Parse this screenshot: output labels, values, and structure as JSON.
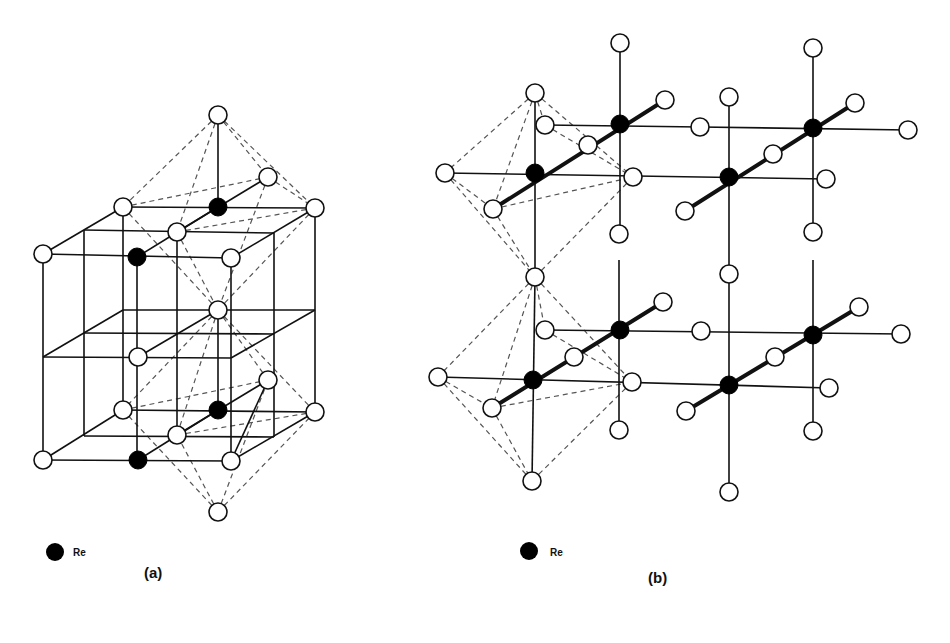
{
  "figure": {
    "panels": [
      {
        "id": "a",
        "label": "(a)",
        "label_pos": [
          144,
          578
        ],
        "legend": {
          "symbol": "filled-circle",
          "text": "Re",
          "symbol_pos": [
            55,
            552
          ],
          "text_pos": [
            73,
            556
          ]
        },
        "solid_lines": [
          [
            43,
            254,
            231,
            258
          ],
          [
            43,
            254,
            43,
            460
          ],
          [
            231,
            258,
            231,
            461
          ],
          [
            43,
            460,
            231,
            461
          ],
          [
            123,
            207,
            315,
            208
          ],
          [
            123,
            207,
            123,
            410
          ],
          [
            315,
            208,
            315,
            412
          ],
          [
            123,
            410,
            315,
            412
          ],
          [
            43,
            254,
            123,
            207
          ],
          [
            231,
            258,
            315,
            208
          ],
          [
            43,
            460,
            123,
            410
          ],
          [
            231,
            461,
            315,
            412
          ],
          [
            84,
            230,
            274,
            233
          ],
          [
            84,
            230,
            84,
            436
          ],
          [
            274,
            233,
            274,
            437
          ],
          [
            84,
            436,
            274,
            437
          ],
          [
            137,
            257,
            218,
            207
          ],
          [
            138,
            460,
            218,
            410
          ],
          [
            137,
            257,
            137,
            460
          ],
          [
            177,
            232,
            177,
            435
          ],
          [
            218,
            115,
            218,
            207
          ],
          [
            218,
            410,
            218,
            310
          ],
          [
            43,
            357,
            231,
            358
          ],
          [
            123,
            310,
            315,
            310
          ],
          [
            43,
            357,
            123,
            310
          ],
          [
            231,
            358,
            315,
            310
          ],
          [
            84,
            333,
            274,
            334
          ],
          [
            138,
            357,
            218,
            310
          ],
          [
            231,
            461,
            268,
            380
          ],
          [
            177,
            435,
            268,
            380
          ],
          [
            177,
            232,
            268,
            177
          ]
        ],
        "dashed_lines": [
          [
            218,
            115,
            123,
            207
          ],
          [
            218,
            115,
            315,
            208
          ],
          [
            218,
            115,
            177,
            232
          ],
          [
            218,
            115,
            268,
            177
          ],
          [
            123,
            207,
            268,
            177
          ],
          [
            123,
            207,
            218,
            310
          ],
          [
            315,
            208,
            218,
            310
          ],
          [
            177,
            232,
            315,
            208
          ],
          [
            268,
            177,
            218,
            310
          ],
          [
            177,
            232,
            218,
            310
          ],
          [
            268,
            177,
            315,
            208
          ],
          [
            218,
            310,
            123,
            410
          ],
          [
            218,
            310,
            315,
            412
          ],
          [
            218,
            310,
            177,
            435
          ],
          [
            218,
            310,
            268,
            380
          ],
          [
            123,
            410,
            268,
            380
          ],
          [
            177,
            435,
            315,
            412
          ],
          [
            218,
            512,
            123,
            410
          ],
          [
            218,
            512,
            315,
            412
          ],
          [
            218,
            512,
            177,
            435
          ],
          [
            218,
            512,
            268,
            380
          ]
        ],
        "o_atoms": [
          [
            218,
            115
          ],
          [
            268,
            177
          ],
          [
            123,
            207
          ],
          [
            315,
            208
          ],
          [
            177,
            232
          ],
          [
            43,
            254
          ],
          [
            231,
            258
          ],
          [
            218,
            310
          ],
          [
            138,
            357
          ],
          [
            268,
            380
          ],
          [
            123,
            410
          ],
          [
            315,
            412
          ],
          [
            177,
            435
          ],
          [
            43,
            460
          ],
          [
            231,
            461
          ],
          [
            218,
            512
          ]
        ],
        "re_atoms": [
          [
            218,
            207
          ],
          [
            137,
            257
          ],
          [
            218,
            410
          ],
          [
            138,
            460
          ]
        ]
      },
      {
        "id": "b",
        "label": "(b)",
        "label_pos": [
          648,
          583
        ],
        "legend": {
          "symbol": "filled-circle",
          "text": "Re",
          "symbol_pos": [
            529,
            551
          ],
          "text_pos": [
            550,
            556
          ]
        },
        "solid_lines": [
          [
            620,
            43,
            620,
            234
          ],
          [
            813,
            48,
            813,
            232
          ],
          [
            729,
            97,
            729,
            274
          ],
          [
            535,
            93,
            535,
            277
          ],
          [
            545,
            125,
            700,
            127
          ],
          [
            700,
            127,
            908,
            130
          ],
          [
            445,
            173,
            826,
            179
          ],
          [
            619,
            260,
            619,
            430
          ],
          [
            813,
            260,
            813,
            431
          ],
          [
            535,
            277,
            532,
            481
          ],
          [
            729,
            274,
            729,
            492
          ],
          [
            545,
            330,
            901,
            334
          ],
          [
            438,
            377,
            829,
            388
          ]
        ],
        "thick_lines": [
          [
            493,
            209,
            665,
            100
          ],
          [
            685,
            211,
            855,
            103
          ],
          [
            492,
            408,
            663,
            302
          ],
          [
            686,
            411,
            859,
            307
          ]
        ],
        "dashed_lines": [
          [
            535,
            93,
            445,
            173
          ],
          [
            535,
            93,
            493,
            209
          ],
          [
            535,
            93,
            633,
            177
          ],
          [
            535,
            93,
            545,
            125
          ],
          [
            445,
            173,
            535,
            277
          ],
          [
            445,
            173,
            493,
            209
          ],
          [
            493,
            209,
            633,
            177
          ],
          [
            493,
            209,
            535,
            277
          ],
          [
            633,
            177,
            535,
            277
          ],
          [
            545,
            125,
            633,
            177
          ],
          [
            535,
            277,
            438,
            377
          ],
          [
            535,
            277,
            492,
            408
          ],
          [
            535,
            277,
            632,
            382
          ],
          [
            535,
            277,
            545,
            330
          ],
          [
            438,
            377,
            532,
            481
          ],
          [
            438,
            377,
            492,
            408
          ],
          [
            492,
            408,
            632,
            382
          ],
          [
            492,
            408,
            532,
            481
          ],
          [
            632,
            382,
            532,
            481
          ],
          [
            545,
            330,
            632,
            382
          ]
        ],
        "o_atoms": [
          [
            620,
            43
          ],
          [
            813,
            48
          ],
          [
            535,
            93
          ],
          [
            729,
            97
          ],
          [
            665,
            100
          ],
          [
            855,
            103
          ],
          [
            545,
            125
          ],
          [
            700,
            127
          ],
          [
            908,
            130
          ],
          [
            588,
            145
          ],
          [
            773,
            154
          ],
          [
            445,
            173
          ],
          [
            633,
            177
          ],
          [
            826,
            179
          ],
          [
            493,
            209
          ],
          [
            685,
            211
          ],
          [
            619,
            234
          ],
          [
            813,
            232
          ],
          [
            535,
            277
          ],
          [
            729,
            274
          ],
          [
            663,
            302
          ],
          [
            859,
            307
          ],
          [
            545,
            330
          ],
          [
            701,
            331
          ],
          [
            901,
            334
          ],
          [
            574,
            357
          ],
          [
            775,
            357
          ],
          [
            438,
            377
          ],
          [
            632,
            382
          ],
          [
            829,
            388
          ],
          [
            492,
            408
          ],
          [
            686,
            411
          ],
          [
            619,
            430
          ],
          [
            813,
            431
          ],
          [
            532,
            481
          ],
          [
            729,
            492
          ]
        ],
        "re_atoms": [
          [
            620,
            124
          ],
          [
            813,
            128
          ],
          [
            535,
            173
          ],
          [
            729,
            177
          ],
          [
            620,
            330
          ],
          [
            813,
            335
          ],
          [
            533,
            380
          ],
          [
            729,
            385
          ]
        ]
      }
    ],
    "atom_radius": {
      "o": 9,
      "re": 9
    },
    "colors": {
      "line": "#111111",
      "dashed": "#555555",
      "re_fill": "#000000",
      "o_fill": "#ffffff"
    }
  }
}
